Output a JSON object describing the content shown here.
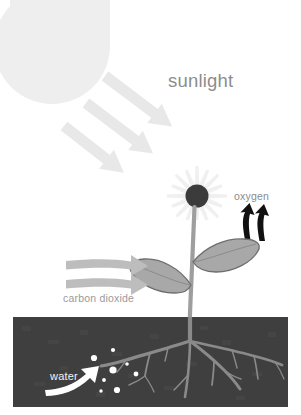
{
  "diagram": {
    "canvas": {
      "width": 301,
      "height": 415,
      "background": "#ffffff"
    },
    "labels": {
      "sunlight": "sunlight",
      "oxygen": "oxygen",
      "carbon_dioxide": "carbon dioxide",
      "water": "water"
    },
    "colors": {
      "background": "#ffffff",
      "sun": "#eeeeee",
      "sunlight_arrow": "#e8e8e8",
      "sunlight_text": "#8d8d8d",
      "flower_petals": "#f0f0f0",
      "flower_center": "#3b3b3b",
      "oxygen_arrow": "#111111",
      "oxygen_text": "#8b8b8b",
      "leaf_fill": "#a8a8a8",
      "leaf_outline": "#6e6e6e",
      "stem": "#9e9e9e",
      "co2_arrow": "#bdbdbd",
      "co2_text": "#9a9a9a",
      "soil": "#3f3f3f",
      "root": "#8a8a8a",
      "water_droplet": "#ffffff",
      "water_arrow": "#ffffff",
      "water_text": "#f2f2f2"
    },
    "elements": {
      "sun": {
        "name": "sun",
        "shape": "partial-circle",
        "anchor": "top-left"
      },
      "sunlight_rays": {
        "name": "sunlight-rays",
        "count": 3,
        "direction": "down-right"
      },
      "flower": {
        "name": "flower-head",
        "petal_count": 16
      },
      "oxygen_arrows": {
        "name": "oxygen-arrows",
        "count": 2,
        "direction": "up"
      },
      "leaves": {
        "name": "leaves",
        "count": 2
      },
      "co2_arrows": {
        "name": "carbon-dioxide-arrows",
        "count": 2,
        "direction": "right"
      },
      "soil": {
        "name": "soil-layer"
      },
      "roots": {
        "name": "root-system"
      },
      "water_droplets": {
        "name": "water-droplets",
        "count": 8
      },
      "water_arrow": {
        "name": "water-uptake-arrow",
        "direction": "up-right"
      }
    }
  }
}
